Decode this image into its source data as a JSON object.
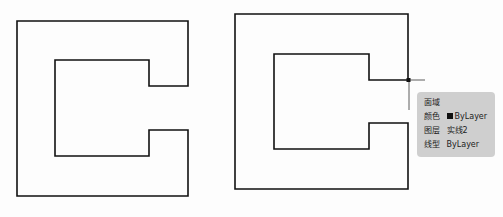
{
  "caption": "",
  "tooltip": {
    "title": "面域",
    "rows": [
      {
        "key": "颜色",
        "value": "ByLayer",
        "swatch_color": "#111111"
      },
      {
        "key": "图层",
        "value": "实线2"
      },
      {
        "key": "线型",
        "value": "ByLayer"
      }
    ]
  },
  "colors": {
    "line": "#111111",
    "tooltip_bg": "#cfcfcf",
    "background": "#fdfdfd"
  }
}
